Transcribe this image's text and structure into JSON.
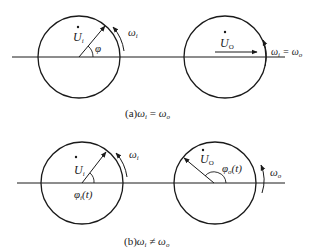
{
  "diagram": {
    "panel_a": {
      "caption_prefix": "(a)",
      "caption_formula": "ω",
      "caption_sub1": "i",
      "caption_op": "=",
      "caption_sub2": "o",
      "left_phasor": {
        "name": "U",
        "sub": "i",
        "angle_label": "φ",
        "rotation_label": "ω",
        "rotation_sub": "i",
        "angle_deg": 50
      },
      "right_phasor": {
        "name": "U",
        "sub": "O",
        "rotation_label": "ω",
        "rotation_sub": "i",
        "rotation_rhs": "= ω",
        "rotation_rhs_sub": "o",
        "angle_deg": 0
      }
    },
    "panel_b": {
      "caption_prefix": "(b)",
      "caption_formula": "ω",
      "caption_sub1": "i",
      "caption_op": "≠",
      "caption_sub2": "o",
      "left_phasor": {
        "name": "U",
        "sub": "i",
        "angle_label": "φ",
        "angle_sub": "i",
        "angle_arg": "(t)",
        "rotation_label": "ω",
        "rotation_sub": "i",
        "angle_deg": 50
      },
      "right_phasor": {
        "name": "U",
        "sub": "O",
        "angle_label": "φ",
        "angle_sub": "o",
        "angle_arg": "(t)",
        "rotation_label": "ω",
        "rotation_sub": "o",
        "angle_deg": 145
      }
    },
    "colors": {
      "stroke": "#1a1a1a",
      "text": "#222222"
    }
  }
}
